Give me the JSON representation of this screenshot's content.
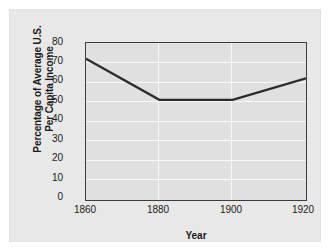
{
  "chart_data": {
    "type": "line",
    "title": "",
    "xlabel": "Year",
    "ylabel_lines": [
      "Percentage of Average U.S.",
      "Per Capita Income"
    ],
    "ylabel": "Percentage of Average U.S. Per Capita Income",
    "x": [
      1860,
      1880,
      1900,
      1920
    ],
    "values": [
      72,
      51,
      51,
      62
    ],
    "series": [
      {
        "name": "Percentage of Average U.S. Per Capita Income",
        "values": [
          72,
          51,
          51,
          62
        ],
        "color": "#2b2b2b"
      }
    ],
    "xlim": [
      1860,
      1920
    ],
    "ylim": [
      0,
      80
    ],
    "xticks": [
      "1860",
      "1880",
      "1900",
      "1920"
    ],
    "yticks": [
      "0",
      "10",
      "20",
      "30",
      "40",
      "50",
      "60",
      "70",
      "80"
    ],
    "grid": true,
    "legend": "none",
    "colors": {
      "page_background": "#e8e8e8",
      "plot_background": "#e0e0e0",
      "gridline": "#f7f7f7",
      "axis": "#3d3d3d",
      "line": "#2b2b2b",
      "text": "#1a1a1a"
    }
  }
}
